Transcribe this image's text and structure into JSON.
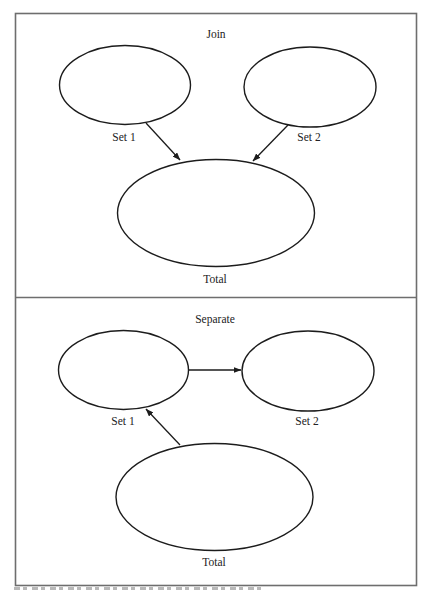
{
  "panels": [
    {
      "title": "Join",
      "nodes": [
        {
          "id": "set1",
          "label": "Set 1"
        },
        {
          "id": "set2",
          "label": "Set 2"
        },
        {
          "id": "total",
          "label": "Total"
        }
      ],
      "edges": [
        {
          "from": "set1",
          "to": "total"
        },
        {
          "from": "set2",
          "to": "total"
        }
      ]
    },
    {
      "title": "Separate",
      "nodes": [
        {
          "id": "set1",
          "label": "Set 1"
        },
        {
          "id": "set2",
          "label": "Set 2"
        },
        {
          "id": "total",
          "label": "Total"
        }
      ],
      "edges": [
        {
          "from": "set1",
          "to": "set2"
        },
        {
          "from": "total",
          "to": "set1"
        }
      ]
    }
  ],
  "caption": {
    "visible": "truncated (text cut off at bottom edge)"
  },
  "colors": {
    "frame": "#6e6e6e",
    "stroke": "#1c1c1c",
    "background": "#ffffff"
  }
}
